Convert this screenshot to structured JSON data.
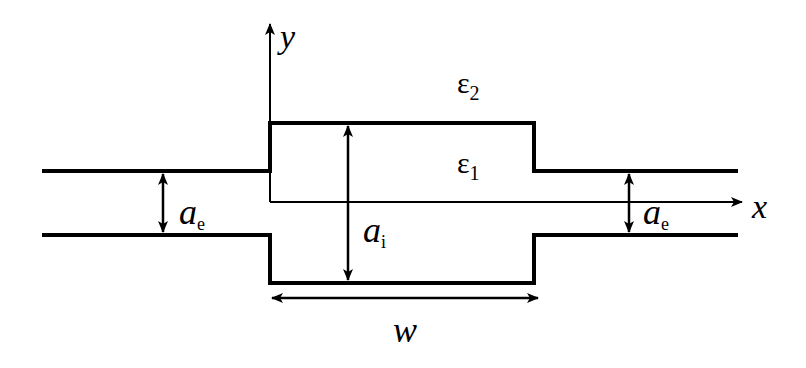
{
  "diagram": {
    "colors": {
      "stroke": "#000000",
      "background": "#ffffff"
    },
    "axes": {
      "x_label": "x",
      "y_label": "y"
    },
    "regions": {
      "outer_medium": {
        "symbol": "ε",
        "subscript": "2"
      },
      "inner_medium": {
        "symbol": "ε",
        "subscript": "1"
      }
    },
    "dimensions": {
      "left_width": {
        "symbol": "a",
        "subscript": "e"
      },
      "inner_height": {
        "symbol": "a",
        "subscript": "i"
      },
      "right_width": {
        "symbol": "a",
        "subscript": "e"
      },
      "cavity_length": {
        "symbol": "w"
      }
    }
  }
}
